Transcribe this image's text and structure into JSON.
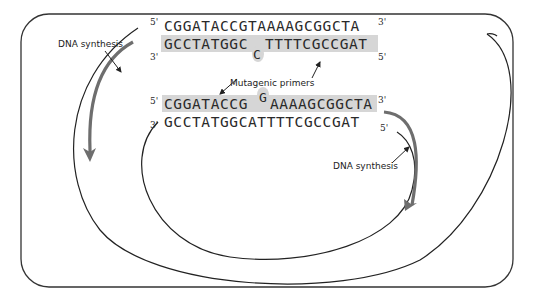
{
  "diagram": {
    "type": "site-directed mutagenesis (PCR with mutagenic primers)",
    "colors": {
      "border": "#333333",
      "strand": "#222222",
      "synthesis_arrow": "#6e6e6e",
      "primer_highlight": "#d4d4d4"
    },
    "top_duplex": {
      "top_strand": {
        "five_prime": "5'",
        "sequence": "CGGATACCGTAAAAGCGGCTA",
        "three_prime": "3'"
      },
      "bottom_primer": {
        "three_prime": "3'",
        "sequence_left": "GCCTATGGC",
        "mismatch_base": "C",
        "sequence_right": "TTTTCGCCGAT",
        "five_prime": "5'"
      }
    },
    "bottom_duplex": {
      "top_primer": {
        "five_prime": "5'",
        "sequence_left": "CGGATACCG",
        "mismatch_base": "G",
        "sequence_right": "AAAAGCGGCTA",
        "three_prime": "3'"
      },
      "bottom_strand": {
        "three_prime": "3'",
        "sequence": "GCCTATGGCATTTTCGCCGAT",
        "five_prime": "5'"
      }
    },
    "labels": {
      "left_synthesis": "DNA synthesis",
      "primers": "Mutagenic primers",
      "right_synthesis": "DNA synthesis"
    }
  }
}
